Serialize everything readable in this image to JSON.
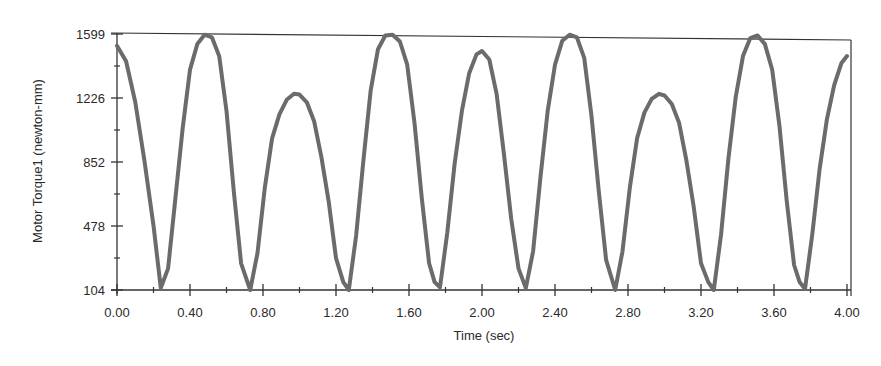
{
  "chart_data": {
    "type": "line",
    "title": "",
    "xlabel": "Time (sec)",
    "ylabel": "Motor Torque1 (newton-mm)",
    "xlim": [
      0.0,
      4.0
    ],
    "ylim": [
      104,
      1599
    ],
    "x_ticks": [
      "0.00",
      "0.40",
      "0.80",
      "1.20",
      "1.60",
      "2.00",
      "2.40",
      "2.80",
      "3.20",
      "3.60",
      "4.00"
    ],
    "y_ticks": [
      "104",
      "478",
      "852",
      "1226",
      "1599"
    ],
    "grid": false,
    "legend": null,
    "line_color": "#6b6b6b",
    "series": [
      {
        "name": "Motor Torque1",
        "x": [
          0.0,
          0.05,
          0.1,
          0.15,
          0.2,
          0.24,
          0.28,
          0.32,
          0.36,
          0.4,
          0.44,
          0.48,
          0.52,
          0.56,
          0.6,
          0.64,
          0.68,
          0.73,
          0.77,
          0.81,
          0.85,
          0.89,
          0.93,
          0.97,
          1.0,
          1.04,
          1.08,
          1.12,
          1.16,
          1.2,
          1.24,
          1.27,
          1.31,
          1.35,
          1.39,
          1.43,
          1.47,
          1.51,
          1.55,
          1.59,
          1.63,
          1.67,
          1.71,
          1.74,
          1.77,
          1.81,
          1.85,
          1.89,
          1.93,
          1.97,
          2.0,
          2.04,
          2.08,
          2.12,
          2.16,
          2.2,
          2.24,
          2.28,
          2.32,
          2.36,
          2.4,
          2.44,
          2.48,
          2.52,
          2.56,
          2.6,
          2.64,
          2.68,
          2.73,
          2.77,
          2.81,
          2.85,
          2.89,
          2.93,
          2.97,
          3.0,
          3.04,
          3.08,
          3.12,
          3.16,
          3.2,
          3.24,
          3.27,
          3.31,
          3.35,
          3.39,
          3.43,
          3.47,
          3.51,
          3.55,
          3.59,
          3.63,
          3.67,
          3.71,
          3.74,
          3.77,
          3.81,
          3.85,
          3.89,
          3.93,
          3.97,
          4.0
        ],
        "values": [
          1530,
          1440,
          1200,
          860,
          480,
          115,
          230,
          640,
          1050,
          1390,
          1540,
          1595,
          1580,
          1470,
          1150,
          680,
          260,
          104,
          320,
          700,
          990,
          1130,
          1215,
          1250,
          1245,
          1200,
          1090,
          880,
          620,
          290,
          150,
          104,
          420,
          860,
          1270,
          1510,
          1590,
          1595,
          1555,
          1420,
          1080,
          640,
          260,
          150,
          120,
          440,
          840,
          1150,
          1370,
          1480,
          1500,
          1450,
          1250,
          900,
          520,
          230,
          115,
          330,
          760,
          1150,
          1420,
          1560,
          1595,
          1580,
          1460,
          1120,
          680,
          280,
          104,
          330,
          700,
          990,
          1140,
          1220,
          1250,
          1240,
          1190,
          1080,
          860,
          590,
          260,
          150,
          104,
          430,
          870,
          1230,
          1470,
          1575,
          1590,
          1540,
          1390,
          1060,
          620,
          250,
          150,
          110,
          430,
          810,
          1100,
          1300,
          1430,
          1470
        ]
      }
    ]
  },
  "axes": {
    "x_title": "Time (sec)",
    "y_title": "Motor Torque1 (newton-mm)",
    "x_tick_labels": [
      "0.00",
      "0.40",
      "0.80",
      "1.20",
      "1.60",
      "2.00",
      "2.40",
      "2.80",
      "3.20",
      "3.60",
      "4.00"
    ],
    "y_tick_labels": [
      "104",
      "478",
      "852",
      "1226",
      "1599"
    ]
  }
}
